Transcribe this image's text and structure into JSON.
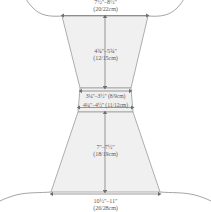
{
  "diagram": {
    "shape": "hourglass-bodice-and-skirt",
    "colors": {
      "fill": "#f0f0f0",
      "outline": "#9a9a9a",
      "dimension_line": "#6f6f6f",
      "text": "#5a5a5a",
      "background": "#ffffff"
    },
    "labels": {
      "top": {
        "name": "top-width",
        "imperial": "7½\"–8½\"",
        "metric": "(20/22cm)"
      },
      "upper": {
        "name": "bodice-height",
        "imperial": "4¾\"–5¾\"",
        "metric": "(12/15cm)"
      },
      "waist_upper": {
        "name": "waist-inner-width",
        "imperial": "3¼\"–3½\" (8/9cm)"
      },
      "waist_lower": {
        "name": "waist-outer-width",
        "imperial": "4¼\"–4½\" (11/12cm)"
      },
      "lower": {
        "name": "skirt-height",
        "imperial": "7\"–7½\"",
        "metric": "(18/19cm)"
      },
      "bottom": {
        "name": "hem-width",
        "imperial": "10½\"–11\"",
        "metric": "(26/28cm)"
      }
    }
  }
}
